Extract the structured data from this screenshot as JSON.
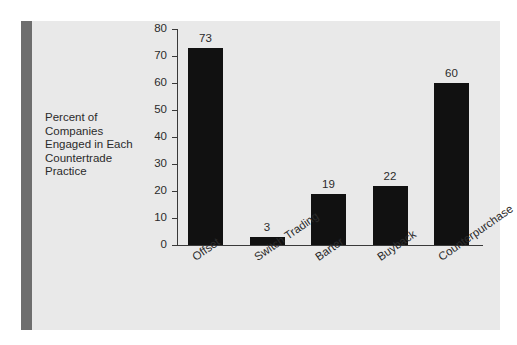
{
  "figure": {
    "background_color": "#ffffff",
    "panel_color": "#e9e9e9",
    "accent_bar_color": "#6e6e6e",
    "bar_color": "#111111",
    "axis_color": "#3a3a3a",
    "text_color": "#2b2b2b"
  },
  "axis_caption": {
    "lines": [
      "Percent of",
      "Companies",
      "Engaged in Each",
      "Countertrade",
      "Practice"
    ],
    "full_text": "Percent of Companies Engaged in Each Countertrade Practice"
  },
  "chart_data": {
    "type": "bar",
    "title": "",
    "subtitle": "",
    "xlabel": "",
    "ylabel": "Percent of Companies Engaged in Each Countertrade Practice",
    "categories": [
      "Offset",
      "Switch Trading",
      "Barter",
      "Buyback",
      "Counterpurchase"
    ],
    "values": [
      73,
      3,
      19,
      22,
      60
    ],
    "data_labels": [
      "73",
      "3",
      "19",
      "22",
      "60"
    ],
    "ylim": [
      0,
      80
    ],
    "ytick_values": [
      0,
      10,
      20,
      30,
      40,
      50,
      60,
      70,
      80
    ],
    "ytick_labels": [
      "0",
      "10",
      "20",
      "30",
      "40",
      "50",
      "60",
      "70",
      "80"
    ],
    "grid": false,
    "legend": null,
    "legend_position": "none",
    "xtick_label_rotation": -35,
    "bar_color": "#111111",
    "orientation": "vertical"
  }
}
